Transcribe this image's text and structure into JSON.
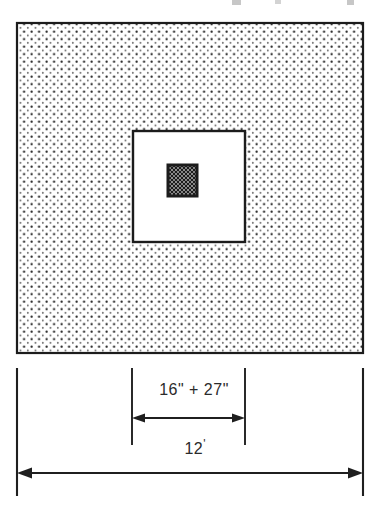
{
  "drawing": {
    "title": "Insulated wall section plan detail",
    "type": "architectural-dimension-diagram",
    "background_color": "#ffffff",
    "ink_color": "#1a1a1a",
    "stipple_color": "#3a3a3a",
    "outer_square": {
      "name": "stippled insulation field",
      "fill_pattern": "stipple-dots",
      "border_color": "#1a1a1a",
      "x": 17,
      "y": 23,
      "width": 346,
      "height": 330
    },
    "middle_square": {
      "name": "white cavity",
      "fill_pattern": "solid-white",
      "border_color": "#1a1a1a",
      "x": 133,
      "y": 131,
      "width": 112,
      "height": 111
    },
    "inner_square": {
      "name": "cross-hatched core",
      "fill_pattern": "cross-hatch",
      "border_color": "#1a1a1a",
      "x": 168,
      "y": 165,
      "width": 29,
      "height": 31
    },
    "dimensions": [
      {
        "id": "inner",
        "label": "16\" + 27\"",
        "value_text": "16\" + 27\"",
        "extension_left_x": 132,
        "extension_right_x": 245,
        "arrow_y": 418,
        "extension_top_y": 368,
        "extension_bottom_y": 445
      },
      {
        "id": "outer",
        "label": "12'",
        "value_text": "12'",
        "extension_left_x": 17,
        "extension_right_x": 363,
        "arrow_y": 473,
        "extension_top_y": 368,
        "extension_bottom_y": 496
      }
    ]
  },
  "labels": {
    "inner_dimension": "16\" + 27\"",
    "outer_dimension_number": "12",
    "outer_dimension_unit": "'"
  }
}
